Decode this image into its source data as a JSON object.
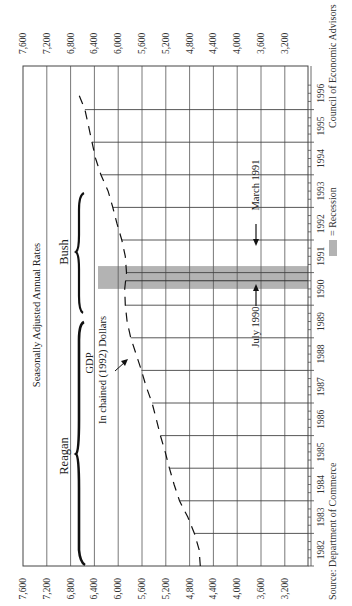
{
  "chart_data": {
    "type": "line",
    "orientation": "rotated-90-ccw",
    "title": "Seasonally Adjusted Annual Rates",
    "series": [
      {
        "name": "GDP In chained (1992) Dollars",
        "style": "dashed",
        "x": [
          1982.0,
          1982.5,
          1983.0,
          1983.5,
          1984.0,
          1984.5,
          1985.0,
          1985.5,
          1986.0,
          1986.5,
          1987.0,
          1987.5,
          1988.0,
          1988.5,
          1989.0,
          1989.5,
          1990.0,
          1990.5,
          1991.0,
          1991.5,
          1992.0,
          1992.5,
          1993.0,
          1993.5,
          1994.0,
          1994.5,
          1995.0,
          1995.5,
          1996.0,
          1996.5
        ],
        "values": [
          4620,
          4640,
          4720,
          4830,
          4970,
          5060,
          5140,
          5210,
          5290,
          5360,
          5430,
          5530,
          5610,
          5700,
          5790,
          5850,
          5880,
          5890,
          5860,
          5880,
          5940,
          6020,
          6090,
          6170,
          6290,
          6380,
          6440,
          6500,
          6560,
          6670
        ]
      }
    ],
    "categories": [
      "1982",
      "1983",
      "1984",
      "1985",
      "1986",
      "1987",
      "1988",
      "1989",
      "1990",
      "1991",
      "1992",
      "1993",
      "1994",
      "1995",
      "1996"
    ],
    "value_axis": {
      "ticks": [
        "7,600",
        "7,200",
        "6,800",
        "6,400",
        "6,000",
        "5,600",
        "5,200",
        "4,800",
        "4,400",
        "4,000",
        "3,600",
        "3,200"
      ],
      "range": [
        3200,
        7600
      ],
      "step": 400
    },
    "recession": {
      "start": "July 1990",
      "end": "March 1991",
      "start_value": 1990.5,
      "end_value": 1991.2,
      "color": "#b3b3b3"
    },
    "annotations": [
      {
        "text": "Reagan",
        "span": [
          1982,
          1989
        ]
      },
      {
        "text": "Bush",
        "span": [
          1989,
          1993
        ]
      },
      {
        "text": "GDP",
        "sub": "In chained (1992) Dollars"
      },
      {
        "text": "July 1990"
      },
      {
        "text": "March 1991"
      }
    ],
    "legend": {
      "swatch_color": "#b3b3b3",
      "label": "= Recession",
      "position": "bottom"
    },
    "grid": true
  },
  "labels": {
    "title": "Seasonally Adjusted Annual Rates",
    "reagan": "Reagan",
    "bush": "Bush",
    "gdp": "GDP",
    "gdp_sub": "In chained (1992) Dollars",
    "july": "July 1990",
    "march": "March 1991",
    "legend": "= Recession",
    "source": "Source: Department of Commerce",
    "credit": "Council of Economic Advisors"
  }
}
